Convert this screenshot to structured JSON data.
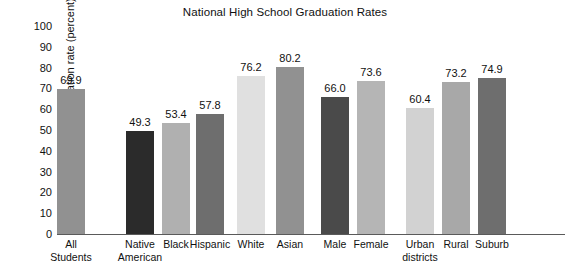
{
  "chart_data": {
    "type": "bar",
    "title": "National High School Graduation Rates",
    "xlabel": "",
    "ylabel": "Graduation rate (percent)",
    "ylim": [
      0,
      100
    ],
    "ytick_labels": [
      "100",
      "90",
      "80",
      "70",
      "60",
      "50",
      "40",
      "30",
      "20",
      "10",
      "0"
    ],
    "yticks": [
      100,
      90,
      80,
      70,
      60,
      50,
      40,
      30,
      20,
      10,
      0
    ],
    "grid": false,
    "legend": "none",
    "categories": [
      "All\nStudents",
      "Native\nAmerican",
      "Black",
      "Hispanic",
      "White",
      "Asian",
      "Male",
      "Female",
      "Urban\ndistricts",
      "Rural",
      "Suburb"
    ],
    "values": [
      69.9,
      49.3,
      53.4,
      57.8,
      76.2,
      80.2,
      66.0,
      73.6,
      60.4,
      73.2,
      74.9
    ],
    "value_labels": [
      "69.9",
      "49.3",
      "53.4",
      "57.8",
      "76.2",
      "80.2",
      "66.0",
      "73.6",
      "60.4",
      "73.2",
      "74.9"
    ],
    "bar_colors": [
      "#919191",
      "#2b2b2b",
      "#b0b0b0",
      "#6e6e6e",
      "#e0e0e0",
      "#919191",
      "#4a4a4a",
      "#b5b5b5",
      "#d2d2d2",
      "#a8a8a8",
      "#6e6e6e"
    ],
    "bar_x": [
      0,
      69,
      105,
      139,
      180,
      219,
      264,
      300,
      349,
      385,
      421
    ],
    "bar_width": 28,
    "groups": [
      {
        "name": "overall",
        "indices": [
          0
        ]
      },
      {
        "name": "race-ethnicity",
        "indices": [
          1,
          2,
          3,
          4,
          5
        ]
      },
      {
        "name": "gender",
        "indices": [
          6,
          7
        ]
      },
      {
        "name": "locale",
        "indices": [
          8,
          9,
          10
        ]
      }
    ]
  }
}
